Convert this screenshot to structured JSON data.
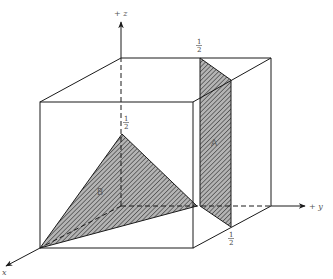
{
  "diagram": {
    "type": "3d-unit-cube-with-planes",
    "axes": {
      "x": {
        "label": "x"
      },
      "y": {
        "label": "+ y"
      },
      "z": {
        "label": "+ z"
      }
    },
    "tick_labels": {
      "z_half": {
        "num": "1",
        "den": "2"
      },
      "y_half_top": {
        "num": "1",
        "den": "2"
      },
      "y_half_bottom": {
        "num": "1",
        "den": "2"
      }
    },
    "planes": [
      {
        "id": "A",
        "label": "A",
        "description": "plane y = 1/2, spanning x from 0 to 1/2"
      },
      {
        "id": "B",
        "label": "B",
        "description": "triangular plane through (1,0,0), (0,0,1/2), (0,1/2,0)"
      }
    ],
    "colors": {
      "line": "#1a1a1a",
      "hatch_fill": "#b4b4b4",
      "hatch_line": "#2a2a2a",
      "background": "#ffffff"
    }
  }
}
